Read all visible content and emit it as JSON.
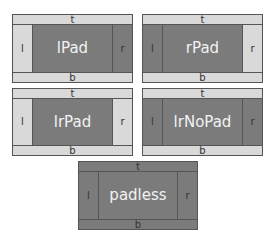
{
  "diagrams": [
    {
      "id": "lpad",
      "label": "lPad",
      "t": "t",
      "b": "b",
      "l": "l",
      "r": "r",
      "x": 12,
      "y": 14,
      "w": 121,
      "h": 69,
      "colors": {
        "t": "light",
        "b": "light",
        "l": "light",
        "r": "dark",
        "center": "dark"
      }
    },
    {
      "id": "rpad",
      "label": "rPad",
      "t": "t",
      "b": "b",
      "l": "l",
      "r": "r",
      "x": 142,
      "y": 14,
      "w": 121,
      "h": 69,
      "colors": {
        "t": "light",
        "b": "light",
        "l": "dark",
        "r": "light",
        "center": "dark"
      }
    },
    {
      "id": "lrpad",
      "label": "lrPad",
      "t": "t",
      "b": "b",
      "l": "l",
      "r": "r",
      "x": 12,
      "y": 88,
      "w": 121,
      "h": 68,
      "colors": {
        "t": "light",
        "b": "light",
        "l": "light",
        "r": "light",
        "center": "dark"
      }
    },
    {
      "id": "lrnopad",
      "label": "lrNoPad",
      "t": "t",
      "b": "b",
      "l": "l",
      "r": "r",
      "x": 142,
      "y": 88,
      "w": 121,
      "h": 68,
      "colors": {
        "t": "light",
        "b": "light",
        "l": "dark",
        "r": "dark",
        "center": "dark"
      }
    },
    {
      "id": "padless",
      "label": "padless",
      "t": "t",
      "b": "b",
      "l": "l",
      "r": "r",
      "x": 78,
      "y": 161,
      "w": 120,
      "h": 69,
      "colors": {
        "t": "dark",
        "b": "dark",
        "l": "dark",
        "r": "dark",
        "center": "dark"
      }
    }
  ]
}
